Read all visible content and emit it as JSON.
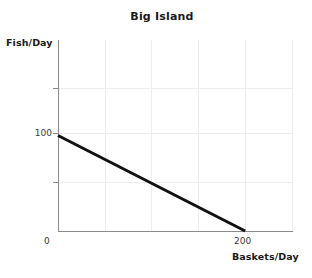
{
  "chart_data": {
    "type": "line",
    "title": "Big Island",
    "xlabel": "Baskets/Day",
    "ylabel": "Fish/Day",
    "xlim": [
      0,
      250
    ],
    "ylim": [
      0,
      200
    ],
    "grid": true,
    "legend": "none",
    "series": [
      {
        "name": "Production possibilities frontier",
        "x": [
          0,
          200
        ],
        "y": [
          100,
          0
        ],
        "color": "#111111",
        "linewidth": 3
      }
    ],
    "x_ticks": [
      {
        "value": 0,
        "label": "0"
      },
      {
        "value": 200,
        "label": "200"
      }
    ],
    "y_ticks": [
      {
        "value": 100,
        "label": "100"
      }
    ],
    "gridlines_x": [
      0,
      50,
      100,
      150,
      200,
      250
    ],
    "gridlines_y": [
      50,
      100,
      150
    ]
  },
  "axes": {
    "title": "Big Island",
    "y_axis_label": "Fish/Day",
    "x_axis_label": "Baskets/Day",
    "y_tick_label_100": "100",
    "x_tick_label_0": "0",
    "x_tick_label_200": "200"
  },
  "colors": {
    "line": "#111111",
    "axis": "#8a8a8a",
    "grid": "#ededed",
    "text": "#1a1a1a",
    "background": "#ffffff"
  }
}
